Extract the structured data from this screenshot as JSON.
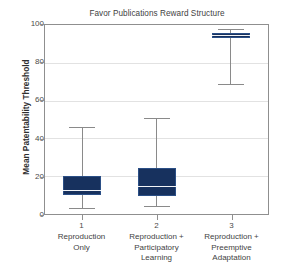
{
  "chart_data": {
    "type": "box",
    "title": "Favor Publications Reward Structure",
    "xlabel": "",
    "ylabel": "Mean Patentability Threshold",
    "ylim": [
      0,
      100
    ],
    "yticks": [
      0,
      20,
      40,
      60,
      80,
      100
    ],
    "ytick_labels": [
      "0",
      "20",
      "40",
      "60",
      "80",
      "100"
    ],
    "grid": true,
    "legend": "none",
    "categories": [
      "1",
      "2",
      "3"
    ],
    "category_labels": [
      "Reproduction\nOnly",
      "Reproduction +\nParticipatory\nLearning",
      "Reproduction +\nPreemptive\nAdaptation"
    ],
    "category_lines": [
      [
        "Reproduction",
        "Only"
      ],
      [
        "Reproduction +",
        "Participatory",
        "Learning"
      ],
      [
        "Reproduction +",
        "Preemptive",
        "Adaptation"
      ]
    ],
    "boxes": [
      {
        "category": "1",
        "whisker_low": 3,
        "q1": 10,
        "median": 12.5,
        "q3": 20,
        "whisker_high": 46
      },
      {
        "category": "2",
        "whisker_low": 4,
        "q1": 9.5,
        "median": 14.5,
        "q3": 24.5,
        "whisker_high": 51
      },
      {
        "category": "3",
        "whisker_low": 69,
        "q1": 93,
        "median": 94.5,
        "q3": 96,
        "whisker_high": 98
      }
    ],
    "colors": {
      "box_fill": "#17315e",
      "box_edge": "#2b4f86",
      "median": "#f2f4f7",
      "whisker": "#8a8a8a",
      "gridline": "#e2e2e2",
      "frame": "#8f8f8f",
      "text": "#3f3f3f",
      "background": "#ffffff"
    }
  }
}
